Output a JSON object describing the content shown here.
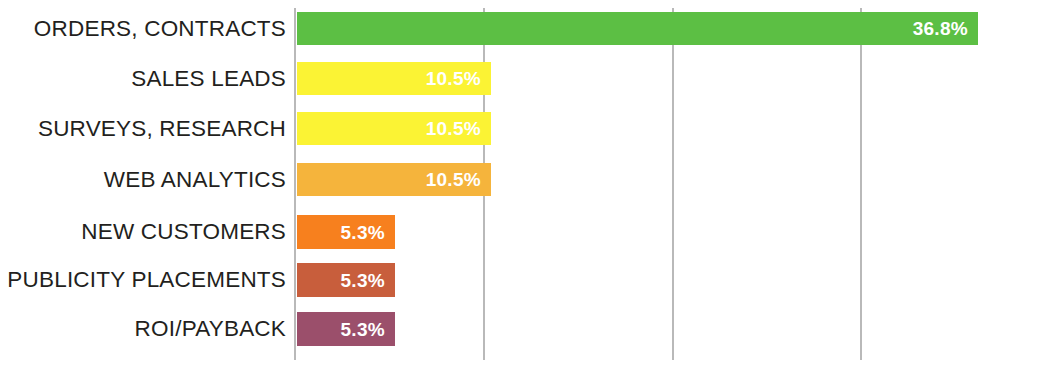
{
  "chart_data": {
    "type": "bar",
    "orientation": "horizontal",
    "title": "",
    "subtitle": "",
    "xlabel": "",
    "ylabel": "",
    "xlim": [
      0,
      53.2
    ],
    "grid": true,
    "grid_axis": "x",
    "gridline_count": 3,
    "legend": "none",
    "value_label_position": "inside-end",
    "value_suffix": "%",
    "categories": [
      "ORDERS, CONTRACTS",
      "SALES LEADS",
      "SURVEYS, RESEARCH",
      "WEB ANALYTICS",
      "NEW CUSTOMERS",
      "PUBLICITY PLACEMENTS",
      "ROI/PAYBACK"
    ],
    "values": [
      36.8,
      10.5,
      10.5,
      10.5,
      5.3,
      5.3,
      5.3
    ],
    "value_labels": [
      "36.8%",
      "10.5%",
      "10.5%",
      "10.5%",
      "5.3%",
      "5.3%",
      "5.3%"
    ],
    "colors": [
      "#5CBF44",
      "#FBF334",
      "#FBF334",
      "#F5B43C",
      "#F7801E",
      "#C85E3C",
      "#9B4F6B"
    ],
    "bars": [
      {
        "label": "ORDERS, CONTRACTS",
        "value": 36.8,
        "value_label": "36.8%",
        "color": "#5CBF44"
      },
      {
        "label": "SALES LEADS",
        "value": 10.5,
        "value_label": "10.5%",
        "color": "#FBF334"
      },
      {
        "label": "SURVEYS, RESEARCH",
        "value": 10.5,
        "value_label": "10.5%",
        "color": "#FBF334"
      },
      {
        "label": "WEB ANALYTICS",
        "value": 10.5,
        "value_label": "10.5%",
        "color": "#F5B43C"
      },
      {
        "label": "NEW CUSTOMERS",
        "value": 5.3,
        "value_label": "5.3%",
        "color": "#F7801E"
      },
      {
        "label": "PUBLICITY PLACEMENTS",
        "value": 5.3,
        "value_label": "5.3%",
        "color": "#C85E3C"
      },
      {
        "label": "ROI/PAYBACK",
        "value": 5.3,
        "value_label": "5.3%",
        "color": "#9B4F6B"
      }
    ]
  },
  "style": {
    "background": "#ffffff",
    "label_color": "#231f20",
    "value_color": "#ffffff",
    "gridline_color": "#b9b9b9",
    "axis_color": "#b9b9b9"
  }
}
